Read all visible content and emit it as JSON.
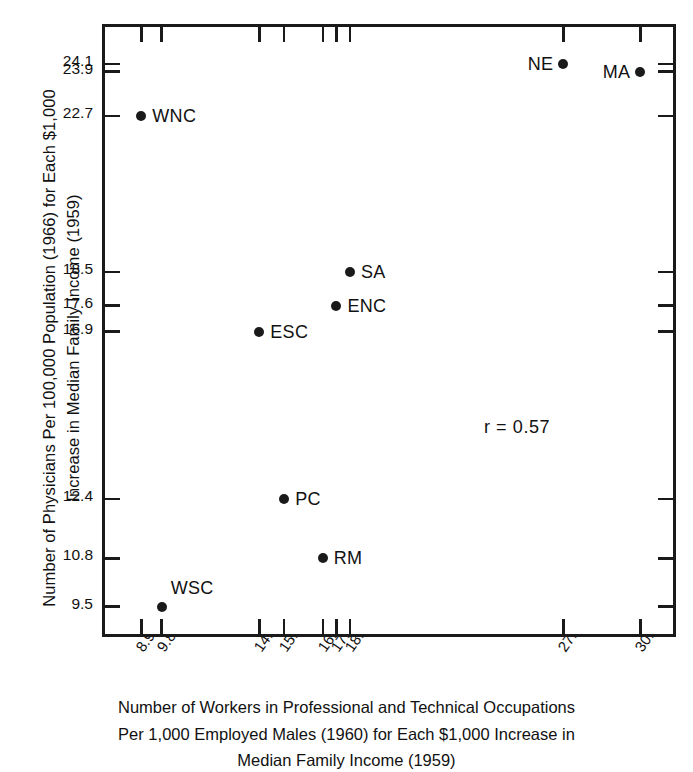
{
  "chart_data": {
    "type": "scatter",
    "title": "",
    "xlabel": "Number of Workers in Professional and Technical Occupations Per 1,000 Employed Males (1960) for Each $1,000 Increase in Median Family Income (1959)",
    "ylabel": "Number of Physicians Per 100,000 Population (1966) for Each $1,000 Increase in Median Family Income (1959)",
    "xlim": [
      7.3,
      32.6
    ],
    "ylim": [
      8.6,
      25.1
    ],
    "grid": false,
    "legend": null,
    "xticks": [
      8.9,
      9.8,
      14.1,
      15.2,
      16.9,
      17.5,
      18.1,
      27.5,
      30.9
    ],
    "xtick_labels": [
      "8.9",
      "9.8",
      "14.1",
      "15.2",
      "16.9",
      "17.5",
      "18.1",
      "27.5",
      "30.9"
    ],
    "yticks": [
      24.1,
      23.9,
      22.7,
      18.5,
      17.6,
      16.9,
      12.4,
      10.8,
      9.5
    ],
    "ytick_labels": [
      "24.1",
      "23.9",
      "22.7",
      "18.5",
      "17.6",
      "16.9",
      "12.4",
      "10.8",
      "9.5"
    ],
    "points": [
      {
        "label": "NE",
        "x": 27.5,
        "y": 24.1,
        "label_side": "left"
      },
      {
        "label": "MA",
        "x": 30.9,
        "y": 23.9,
        "label_side": "left"
      },
      {
        "label": "WNC",
        "x": 8.9,
        "y": 22.7,
        "label_side": "right"
      },
      {
        "label": "SA",
        "x": 18.1,
        "y": 18.5,
        "label_side": "right"
      },
      {
        "label": "ENC",
        "x": 17.5,
        "y": 17.6,
        "label_side": "right"
      },
      {
        "label": "ESC",
        "x": 14.1,
        "y": 16.9,
        "label_side": "right"
      },
      {
        "label": "PC",
        "x": 15.2,
        "y": 12.4,
        "label_side": "right"
      },
      {
        "label": "RM",
        "x": 16.9,
        "y": 10.8,
        "label_side": "right"
      },
      {
        "label": "WSC",
        "x": 9.8,
        "y": 9.5,
        "label_side": "above-right"
      }
    ],
    "annotations": [
      {
        "text": "r = 0.57",
        "x": 24.0,
        "y": 14.6
      }
    ],
    "correlation": 0.57,
    "marker_color": "#1a1a1a",
    "axis_color": "#1a1a1a",
    "background_color": "#ffffff"
  },
  "axis_titles": {
    "y_lines": [
      "Number of Physicians Per 100,000 Population (1966) for Each $1,000",
      "Increase in Median Family Income (1959)"
    ],
    "x_lines": [
      "Number of Workers in Professional and Technical Occupations",
      "Per 1,000 Employed Males (1960) for Each $1,000 Increase in",
      "Median Family Income (1959)"
    ]
  }
}
